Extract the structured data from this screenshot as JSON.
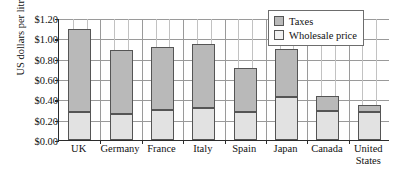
{
  "chart_data": {
    "type": "bar",
    "subtype": "stacked-bar",
    "title": "",
    "xlabel": "",
    "ylabel": "US dollars per litre",
    "ylim": [
      0.0,
      1.2
    ],
    "ytick_step": 0.2,
    "ytick_labels": [
      "$1.20",
      "$1.00",
      "$0.80",
      "$0.60",
      "$0.40",
      "$0.20",
      "$0.00"
    ],
    "ytick_values": [
      1.2,
      1.0,
      0.8,
      0.6,
      0.4,
      0.2,
      0.0
    ],
    "grid": "both",
    "legend_position": "top-right",
    "categories": [
      "UK",
      "Germany",
      "France",
      "Italy",
      "Spain",
      "Japan",
      "Canada",
      "United States"
    ],
    "category_lines": [
      [
        "UK"
      ],
      [
        "Germany"
      ],
      [
        "France"
      ],
      [
        "Italy"
      ],
      [
        "Spain"
      ],
      [
        "Japan"
      ],
      [
        "Canada"
      ],
      [
        "United",
        "States"
      ]
    ],
    "series": [
      {
        "name": "Wholesale price",
        "color": "#e2e2e2",
        "values": [
          0.28,
          0.26,
          0.3,
          0.31,
          0.28,
          0.42,
          0.29,
          0.28
        ]
      },
      {
        "name": "Taxes",
        "color": "#b9b9b9",
        "values": [
          0.81,
          0.63,
          0.61,
          0.63,
          0.43,
          0.48,
          0.14,
          0.06
        ]
      }
    ],
    "totals": [
      1.09,
      0.89,
      0.91,
      0.94,
      0.71,
      0.9,
      0.43,
      0.34
    ]
  },
  "legend": {
    "items": [
      {
        "label": "Taxes",
        "key": "taxes"
      },
      {
        "label": "Wholesale price",
        "key": "wholesale"
      }
    ]
  }
}
